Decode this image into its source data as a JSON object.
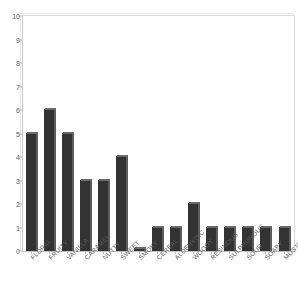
{
  "chart_data": {
    "type": "bar",
    "title": "",
    "xlabel": "",
    "ylabel": "",
    "ylim": [
      0,
      10
    ],
    "xlim_categories": 15,
    "grid": false,
    "legend": null,
    "y_ticks": [
      0,
      1,
      2,
      3,
      4,
      5,
      6,
      7,
      8,
      9,
      10
    ],
    "categories": [
      "FLORAL",
      "FRUITY",
      "VANILLA",
      "CARAMEL",
      "NUTTY",
      "SWEET",
      "SMOKY",
      "CEREAL",
      "ALDEHYDIC",
      "WOODY",
      "RESINOUS",
      "SULPHUROUS",
      "SOUR",
      "SOAPY",
      "MUSTY"
    ],
    "values": [
      5,
      6,
      5,
      3,
      3,
      4,
      0.1,
      1,
      1,
      2,
      1,
      1,
      1,
      1,
      1
    ],
    "bar_color": "#333333",
    "bar_edge_color": "#1a1a1a",
    "plot_background": "#ffffff",
    "frame_color": "#d2d2d2",
    "axis_text_color": "#5a5a5a",
    "label_rotation_degrees": -45
  }
}
